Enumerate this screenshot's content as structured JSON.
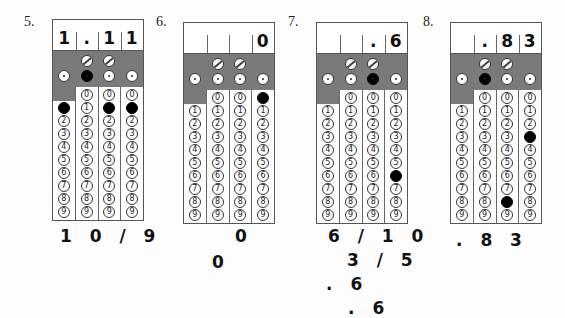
{
  "questions": [
    {
      "number": "5.",
      "header": [
        "1",
        ".",
        "1",
        "1"
      ],
      "fraction_filled": [
        false,
        false
      ],
      "decimal_filled": [
        false,
        true,
        false,
        false
      ],
      "filled_digits": [
        1,
        null,
        1,
        1
      ],
      "answers": [
        "1 0 / 9"
      ]
    },
    {
      "number": "6.",
      "header": [
        "",
        "",
        "",
        "0"
      ],
      "fraction_filled": [
        false,
        false
      ],
      "decimal_filled": [
        false,
        false,
        false,
        false
      ],
      "filled_digits": [
        null,
        null,
        null,
        0
      ],
      "answers": [
        "0",
        "0"
      ]
    },
    {
      "number": "7.",
      "header": [
        "",
        "",
        ".",
        "6"
      ],
      "fraction_filled": [
        false,
        false
      ],
      "decimal_filled": [
        false,
        false,
        true,
        false
      ],
      "filled_digits": [
        null,
        null,
        null,
        6
      ],
      "answers": [
        "6 / 1 0",
        "3 / 5",
        ". 6",
        ". 6"
      ]
    },
    {
      "number": "8.",
      "header": [
        "",
        ".",
        "8",
        "3"
      ],
      "fraction_filled": [
        false,
        false
      ],
      "decimal_filled": [
        false,
        true,
        false,
        false
      ],
      "filled_digits": [
        null,
        null,
        8,
        3
      ],
      "answers": [
        ". 8 3"
      ]
    }
  ],
  "digits": [
    "0",
    "1",
    "2",
    "3",
    "4",
    "5",
    "6",
    "7",
    "8",
    "9"
  ],
  "colors": {
    "shade": "#7a7a7a",
    "fill": "#000000",
    "border": "#555555"
  }
}
